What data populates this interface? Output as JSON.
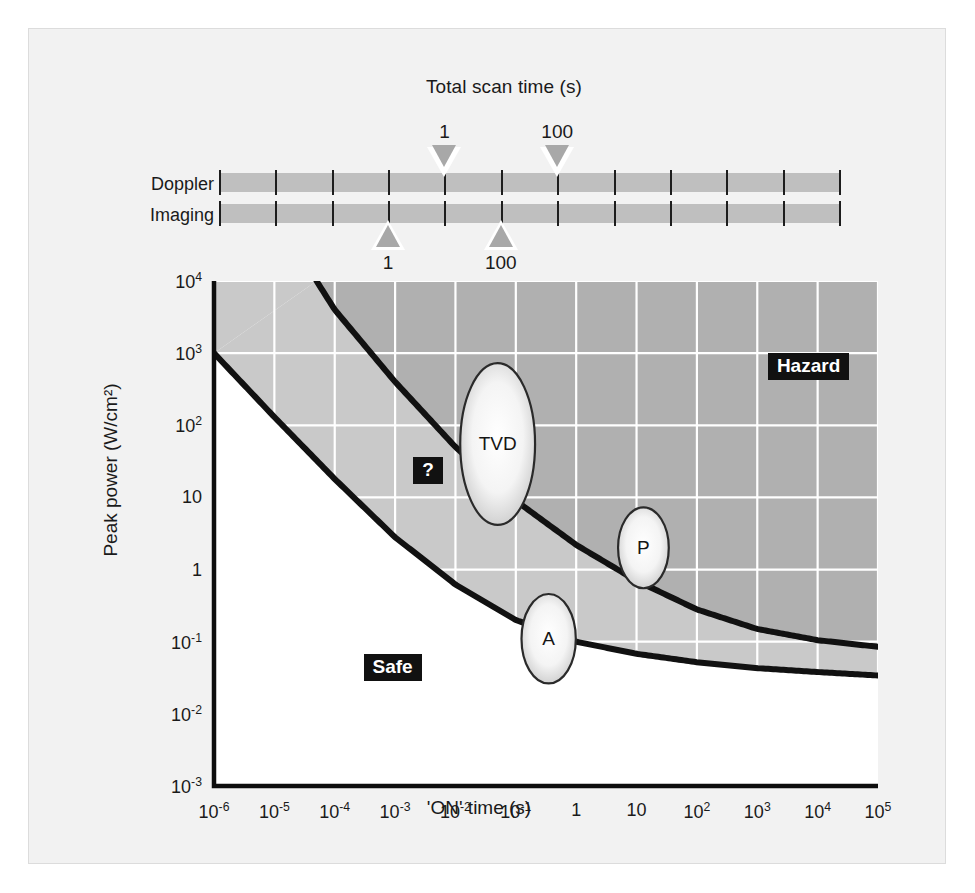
{
  "figure": {
    "background": "#f2f2f2",
    "border_color": "#dcdcdc"
  },
  "scan_ruler": {
    "title": "Total scan time (s)",
    "rows": [
      {
        "label": "Doppler",
        "marker_direction": "down",
        "markers": [
          {
            "value": "1",
            "x_decade": -2
          },
          {
            "value": "100",
            "x_decade": 0
          }
        ]
      },
      {
        "label": "Imaging",
        "marker_direction": "up",
        "markers": [
          {
            "value": "1",
            "x_decade": -3
          },
          {
            "value": "100",
            "x_decade": -1
          }
        ]
      }
    ],
    "bar_color": "#bfbfbf",
    "tick_color": "#1d1d1d",
    "marker_fill": "#a8a8a8",
    "marker_outline": "#ffffff"
  },
  "chart_data": {
    "type": "line",
    "title": "",
    "xlabel": "'ON' time (s)",
    "ylabel": "Peak power (W/cm²)",
    "xscale": "log",
    "yscale": "log",
    "xlim": [
      1e-06,
      100000.0
    ],
    "ylim": [
      0.001,
      10000.0
    ],
    "grid": true,
    "grid_color": "#ffffff",
    "x_ticks": [
      "10⁻⁶",
      "10⁻⁵",
      "10⁻⁴",
      "10⁻³",
      "10⁻²",
      "10⁻¹",
      "1",
      "10",
      "10²",
      "10³",
      "10⁴",
      "10⁵"
    ],
    "x_tick_values": [
      1e-06,
      1e-05,
      0.0001,
      0.001,
      0.01,
      0.1,
      1,
      10,
      100,
      1000,
      10000,
      100000
    ],
    "y_ticks": [
      "10⁴",
      "10³",
      "10²",
      "10",
      "1",
      "10⁻¹",
      "10⁻²",
      "10⁻³"
    ],
    "y_tick_values": [
      10000,
      1000,
      100,
      10,
      1,
      0.1,
      0.01,
      0.001
    ],
    "regions": [
      {
        "name": "Safe",
        "label": "Safe",
        "fill": "#ffffff",
        "label_x": 0.0003,
        "label_y": 0.04
      },
      {
        "name": "Unknown",
        "label": "?",
        "fill": "#c9c9c9",
        "label_x": 0.002,
        "label_y": 22
      },
      {
        "name": "Hazard",
        "label": "Hazard",
        "fill": "#b0b0b0",
        "label_x": 1500.0,
        "label_y": 600.0
      }
    ],
    "series": [
      {
        "name": "upper-threshold",
        "description": "Hazard boundary curve",
        "color": "#111111",
        "x": [
          5e-05,
          0.0001,
          0.001,
          0.01,
          0.1,
          1,
          10,
          100,
          1000,
          10000,
          100000
        ],
        "y": [
          10000.0,
          4000.0,
          400.0,
          50.0,
          9.0,
          2.2,
          0.7,
          0.28,
          0.15,
          0.105,
          0.085
        ]
      },
      {
        "name": "lower-threshold",
        "description": "Safe boundary curve",
        "color": "#111111",
        "x": [
          1e-06,
          1e-05,
          0.0001,
          0.001,
          0.01,
          0.1,
          1,
          10,
          100,
          1000,
          10000,
          100000
        ],
        "y": [
          1000.0,
          130.0,
          18.0,
          2.8,
          0.62,
          0.2,
          0.1,
          0.068,
          0.052,
          0.043,
          0.038,
          0.034
        ]
      }
    ],
    "markers": [
      {
        "label": "TVD",
        "cx": 0.05,
        "cy": 55,
        "rx_decades": 0.62,
        "ry_decades": 1.12
      },
      {
        "label": "P",
        "cx": 13,
        "cy": 2.0,
        "rx_decades": 0.42,
        "ry_decades": 0.56
      },
      {
        "label": "A",
        "cx": 0.35,
        "cy": 0.11,
        "rx_decades": 0.45,
        "ry_decades": 0.62
      }
    ],
    "annotations": [
      "Hazard",
      "?",
      "Safe",
      "TVD",
      "P",
      "A"
    ]
  }
}
